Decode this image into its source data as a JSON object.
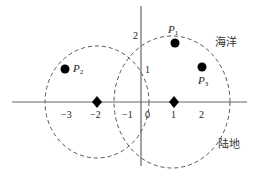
{
  "diagram": {
    "type": "coordinate-plane-with-circles",
    "axes": {
      "x_ticks": [
        {
          "value": -3,
          "label": "−3"
        },
        {
          "value": -2,
          "label": "−2"
        },
        {
          "value": -1,
          "label": "−1"
        },
        {
          "value": 0,
          "label": "0"
        },
        {
          "value": 1,
          "label": "1"
        },
        {
          "value": 2,
          "label": "2"
        }
      ],
      "y_ticks": [
        {
          "value": 1,
          "label": "1"
        },
        {
          "value": 2,
          "label": "2"
        }
      ]
    },
    "regions": {
      "sea": "海洋",
      "land": "陆地"
    },
    "points": [
      {
        "name": "P",
        "sub": "1",
        "shape": "dot"
      },
      {
        "name": "P",
        "sub": "2",
        "shape": "dot"
      },
      {
        "name": "P",
        "sub": "3",
        "shape": "dot"
      }
    ],
    "centers": [
      {
        "x": -2,
        "shape": "diamond"
      },
      {
        "x": 1,
        "shape": "diamond"
      }
    ],
    "circles": [
      {
        "center": "-2",
        "style": "dashed"
      },
      {
        "center": "1",
        "style": "dashed"
      }
    ],
    "colors": {
      "axis": "#555555",
      "circle": "#555555",
      "marker": "#000000",
      "text": "#222222"
    }
  }
}
